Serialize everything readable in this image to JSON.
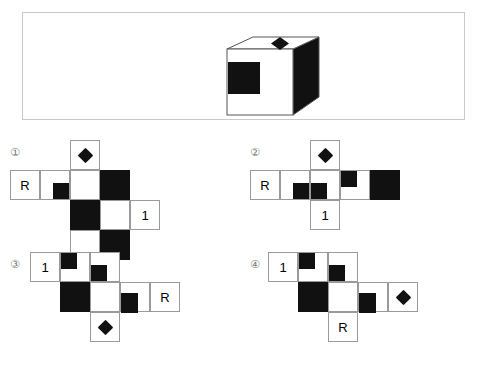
{
  "page": {
    "background_color": "#ffffff",
    "panel_border_color": "#c9c9c9",
    "grid_line_color": "#9a9a9a",
    "fill_color": "#111111"
  },
  "question": {
    "panel_label": "cube-question-panel",
    "figure": {
      "type": "isometric-cube",
      "faces": {
        "top": {
          "name": "top-face",
          "background": "#ffffff",
          "marks": [
            {
              "symbol": "diamond",
              "fill": "#111111"
            }
          ]
        },
        "front": {
          "name": "front-face",
          "background": "#ffffff",
          "marks": [
            {
              "symbol": "square",
              "fill": "#111111",
              "position": "upper-left"
            }
          ]
        },
        "right": {
          "name": "right-face",
          "background": "#111111",
          "marks": []
        }
      }
    }
  },
  "options": [
    {
      "id": "option-1",
      "label": "①",
      "cells": [
        {
          "col": 2,
          "row": 0,
          "fill": "white",
          "glyph": "diamond"
        },
        {
          "col": 0,
          "row": 1,
          "fill": "white",
          "glyph": "R"
        },
        {
          "col": 1,
          "row": 1,
          "fill": "white",
          "glyph": ""
        },
        {
          "col": 2,
          "row": 1,
          "fill": "white",
          "glyph": ""
        },
        {
          "col": 3,
          "row": 1,
          "fill": "black",
          "glyph": ""
        },
        {
          "col": 2,
          "row": 2,
          "fill": "black",
          "glyph": ""
        },
        {
          "col": 3,
          "row": 2,
          "fill": "white",
          "glyph": ""
        },
        {
          "col": 4,
          "row": 2,
          "fill": "white",
          "glyph": "1"
        },
        {
          "col": 2,
          "row": 3,
          "fill": "white",
          "glyph": ""
        },
        {
          "col": 3,
          "row": 3,
          "fill": "black",
          "glyph": ""
        }
      ],
      "partial_fills": [
        {
          "col": 1,
          "row": 1,
          "corner": "bottom-right",
          "fill": "black"
        }
      ]
    },
    {
      "id": "option-2",
      "label": "②",
      "cells": [
        {
          "col": 2,
          "row": 0,
          "fill": "white",
          "glyph": "diamond"
        },
        {
          "col": 0,
          "row": 1,
          "fill": "white",
          "glyph": "R"
        },
        {
          "col": 1,
          "row": 1,
          "fill": "white",
          "glyph": ""
        },
        {
          "col": 2,
          "row": 1,
          "fill": "white",
          "glyph": ""
        },
        {
          "col": 3,
          "row": 1,
          "fill": "white",
          "glyph": ""
        },
        {
          "col": 4,
          "row": 1,
          "fill": "black",
          "glyph": ""
        },
        {
          "col": 2,
          "row": 2,
          "fill": "white",
          "glyph": "1"
        }
      ],
      "partial_fills": [
        {
          "col": 1,
          "row": 1,
          "corner": "bottom-right",
          "fill": "black"
        },
        {
          "col": 2,
          "row": 1,
          "corner": "bottom-left",
          "fill": "black"
        },
        {
          "col": 3,
          "row": 1,
          "corner": "top-left",
          "fill": "black"
        }
      ]
    },
    {
      "id": "option-3",
      "label": "③",
      "cells": [
        {
          "col": 0,
          "row": 0,
          "fill": "white",
          "glyph": "1"
        },
        {
          "col": 1,
          "row": 0,
          "fill": "white",
          "glyph": ""
        },
        {
          "col": 2,
          "row": 0,
          "fill": "white",
          "glyph": ""
        },
        {
          "col": 1,
          "row": 1,
          "fill": "black",
          "glyph": ""
        },
        {
          "col": 2,
          "row": 1,
          "fill": "white",
          "glyph": ""
        },
        {
          "col": 3,
          "row": 1,
          "fill": "white",
          "glyph": ""
        },
        {
          "col": 4,
          "row": 1,
          "fill": "white",
          "glyph": "R"
        },
        {
          "col": 2,
          "row": 2,
          "fill": "white",
          "glyph": "diamond"
        }
      ],
      "partial_fills": [
        {
          "col": 1,
          "row": 0,
          "corner": "top-left",
          "fill": "black"
        },
        {
          "col": 2,
          "row": 0,
          "corner": "bottom-left",
          "fill": "black"
        },
        {
          "col": 3,
          "row": 1,
          "corner": "left",
          "fill": "black"
        }
      ]
    },
    {
      "id": "option-4",
      "label": "④",
      "cells": [
        {
          "col": 0,
          "row": 0,
          "fill": "white",
          "glyph": "1"
        },
        {
          "col": 1,
          "row": 0,
          "fill": "white",
          "glyph": ""
        },
        {
          "col": 2,
          "row": 0,
          "fill": "white",
          "glyph": ""
        },
        {
          "col": 1,
          "row": 1,
          "fill": "black",
          "glyph": ""
        },
        {
          "col": 2,
          "row": 1,
          "fill": "white",
          "glyph": ""
        },
        {
          "col": 3,
          "row": 1,
          "fill": "white",
          "glyph": ""
        },
        {
          "col": 4,
          "row": 1,
          "fill": "white",
          "glyph": "diamond"
        },
        {
          "col": 2,
          "row": 2,
          "fill": "white",
          "glyph": "R"
        }
      ],
      "partial_fills": [
        {
          "col": 1,
          "row": 0,
          "corner": "top-left",
          "fill": "black"
        },
        {
          "col": 2,
          "row": 0,
          "corner": "bottom-left",
          "fill": "black"
        },
        {
          "col": 3,
          "row": 1,
          "corner": "left",
          "fill": "black"
        }
      ]
    }
  ]
}
